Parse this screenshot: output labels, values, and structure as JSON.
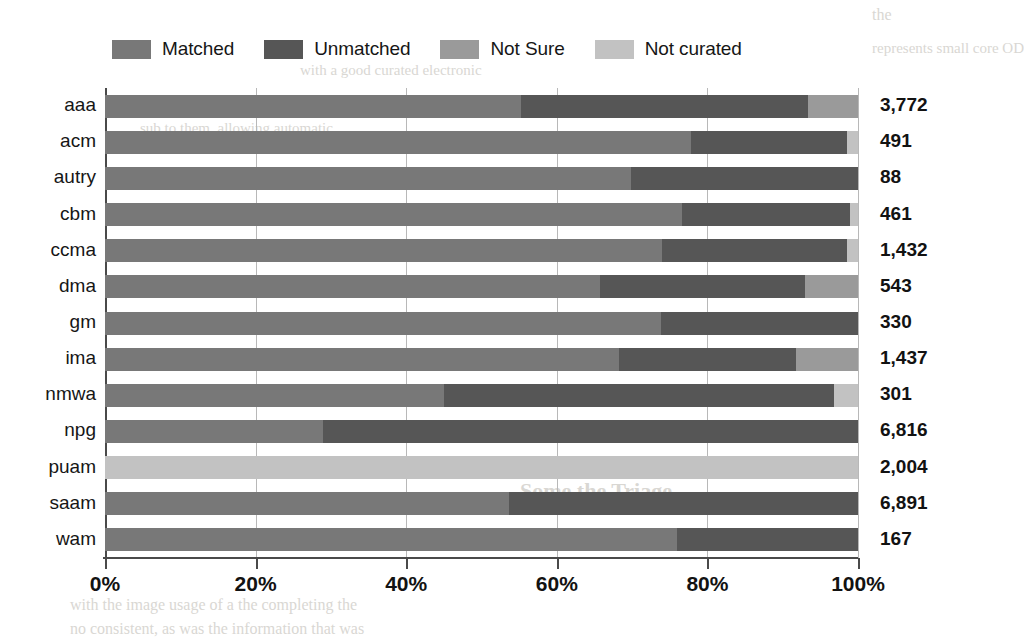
{
  "chart_data": {
    "type": "bar",
    "orientation": "horizontal",
    "stacked": true,
    "normalized_percent": true,
    "title": "",
    "xlabel": "",
    "ylabel": "",
    "xlim": [
      0,
      100
    ],
    "xticks": [
      "0%",
      "20%",
      "40%",
      "60%",
      "80%",
      "100%"
    ],
    "xtick_values": [
      0,
      20,
      40,
      60,
      80,
      100
    ],
    "grid": true,
    "legend_position": "top",
    "categories": [
      "aaa",
      "acm",
      "autry",
      "cbm",
      "ccma",
      "dma",
      "gm",
      "ima",
      "nmwa",
      "npg",
      "puam",
      "saam",
      "wam"
    ],
    "totals": [
      "3,772",
      "491",
      "88",
      "461",
      "1,432",
      "543",
      "330",
      "1,437",
      "301",
      "6,816",
      "2,004",
      "6,891",
      "167"
    ],
    "total_values": [
      3772,
      491,
      88,
      461,
      1432,
      543,
      330,
      1437,
      301,
      6816,
      2004,
      6891,
      167
    ],
    "series": [
      {
        "name": "Matched",
        "color": "#787878",
        "values": [
          55.2,
          77.8,
          69.8,
          76.6,
          74.0,
          65.8,
          73.8,
          68.2,
          45.0,
          29.0,
          0.0,
          53.6,
          76.0
        ]
      },
      {
        "name": "Unmatched",
        "color": "#565656",
        "values": [
          38.2,
          20.7,
          30.2,
          22.4,
          24.5,
          27.2,
          26.2,
          23.6,
          51.8,
          71.0,
          0.0,
          46.4,
          24.0
        ]
      },
      {
        "name": "Not Sure",
        "color": "#9a9a9a",
        "values": [
          6.6,
          0.0,
          0.0,
          0.0,
          0.0,
          7.0,
          0.0,
          8.2,
          0.0,
          0.0,
          0.0,
          0.0,
          0.0
        ]
      },
      {
        "name": "Not curated",
        "color": "#c2c2c2",
        "values": [
          0.0,
          1.5,
          0.0,
          1.0,
          1.5,
          0.0,
          0.0,
          0.0,
          3.2,
          0.0,
          100.0,
          0.0,
          0.0
        ]
      }
    ]
  },
  "legend": {
    "items": [
      {
        "label": "Matched",
        "color": "#787878"
      },
      {
        "label": "Unmatched",
        "color": "#565656"
      },
      {
        "label": "Not Sure",
        "color": "#9a9a9a"
      },
      {
        "label": "Not curated",
        "color": "#c2c2c2"
      }
    ]
  },
  "background_text": {
    "fragments": [
      "the",
      "represents small core OD",
      "with a good curated electronic",
      "sub to them, allowing automatic",
      "Some the Triage",
      "with the image usage of a the completing the",
      "no consistent, as was the information that was"
    ]
  }
}
